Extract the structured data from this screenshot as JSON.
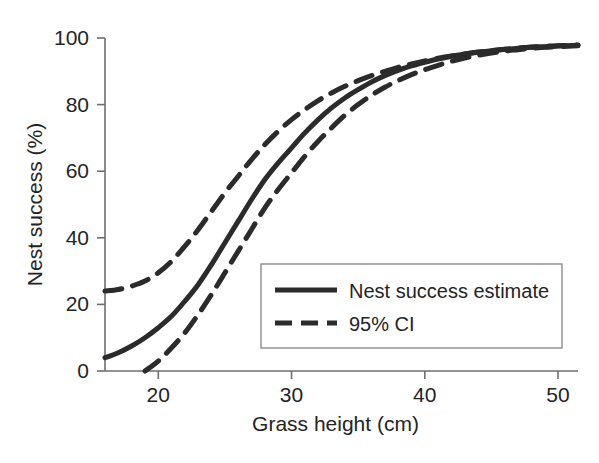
{
  "chart_data": {
    "type": "line",
    "title": "",
    "xlabel": "Grass height (cm)",
    "ylabel": "Nest success (%)",
    "xlim": [
      16,
      51.5
    ],
    "ylim": [
      0,
      100
    ],
    "xticks": [
      20,
      30,
      40,
      50
    ],
    "yticks": [
      0,
      20,
      40,
      60,
      80,
      100
    ],
    "xtick_labels": [
      "20",
      "30",
      "40",
      "50"
    ],
    "ytick_labels": [
      "0",
      "20",
      "40",
      "60",
      "80",
      "100"
    ],
    "grid": false,
    "legend_position": "lower right",
    "line_color": "#2b2b2b",
    "axis_color": "#6e6e6e",
    "series": [
      {
        "name": "Nest success estimate",
        "style": "solid",
        "x": [
          16,
          17,
          18,
          19,
          20,
          21,
          22,
          23,
          24,
          25,
          26,
          27,
          28,
          29,
          30,
          31,
          32,
          33,
          34,
          35,
          36,
          37,
          38,
          39,
          40,
          41,
          42,
          43,
          44,
          45,
          46,
          47,
          48,
          49,
          50,
          51.5
        ],
        "values": [
          4,
          5.5,
          7.5,
          10,
          13,
          16.5,
          21,
          26,
          32,
          38.5,
          45,
          51.5,
          57.5,
          62.5,
          67,
          71.5,
          75.5,
          79,
          82,
          84.5,
          86.8,
          88.7,
          90.3,
          91.6,
          92.7,
          93.7,
          94.5,
          95.2,
          95.7,
          96.2,
          96.6,
          96.9,
          97.2,
          97.4,
          97.6,
          97.8
        ]
      },
      {
        "name": "95% CI upper",
        "style": "dashed",
        "x": [
          16,
          17,
          18,
          19,
          20,
          21,
          22,
          23,
          24,
          25,
          26,
          27,
          28,
          29,
          30,
          31,
          32,
          33,
          34,
          35,
          36,
          37,
          38,
          39,
          40,
          41,
          42,
          43,
          44,
          45,
          46,
          47,
          48,
          49,
          50,
          51.5
        ],
        "values": [
          24,
          24.5,
          25.5,
          27,
          29.5,
          33,
          37.5,
          42.5,
          48,
          53.5,
          58.5,
          63.5,
          68,
          72,
          75.5,
          78.5,
          81.2,
          83.5,
          85.5,
          87.2,
          88.7,
          90,
          91.2,
          92.2,
          93.1,
          93.9,
          94.6,
          95.2,
          95.8,
          96.2,
          96.6,
          97,
          97.3,
          97.5,
          97.7,
          97.9
        ]
      },
      {
        "name": "95% CI lower",
        "style": "dashed",
        "x": [
          19,
          20,
          21,
          22,
          23,
          24,
          25,
          26,
          27,
          28,
          29,
          30,
          31,
          32,
          33,
          34,
          35,
          36,
          37,
          38,
          39,
          40,
          41,
          42,
          43,
          44,
          45,
          46,
          47,
          48,
          49,
          50,
          51.5
        ],
        "values": [
          0,
          3,
          7,
          11.5,
          17,
          23,
          29.5,
          36,
          42.5,
          49,
          54.5,
          59.5,
          64.5,
          69,
          73,
          76.8,
          80,
          82.8,
          85.2,
          87.2,
          89,
          90.5,
          91.8,
          93,
          94,
          94.8,
          95.5,
          96.1,
          96.5,
          96.9,
          97.2,
          97.4,
          97.7
        ]
      }
    ],
    "legend": [
      {
        "label": "Nest success estimate",
        "style": "solid"
      },
      {
        "label": "95% CI",
        "style": "dashed"
      }
    ]
  }
}
